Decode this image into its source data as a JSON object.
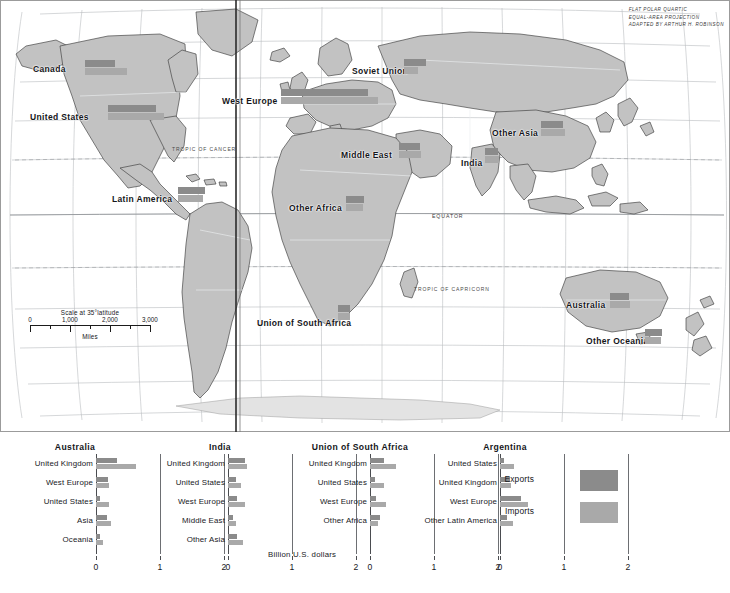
{
  "map": {
    "projection_note": "FLAT POLAR QUARTIC\nEQUAL-AREA PROJECTION\nADAPTED BY ARTHUR H. ROBINSON",
    "projection_line1": "FLAT POLAR QUARTIC",
    "projection_line2": "EQUAL-AREA PROJECTION",
    "projection_line3": "ADAPTED BY ARTHUR H. ROBINSON",
    "equator_label": "EQUATOR",
    "tropic_cancer_label": "TROPIC OF CANCER",
    "tropic_capricorn_label": "TROPIC OF CAPRICORN",
    "scale": {
      "caption": "Scale at 35°latitude",
      "unit": "Miles",
      "ticks": [
        "0",
        "1,000",
        "2,000",
        "3,000"
      ]
    },
    "regions": [
      {
        "label": "Canada",
        "label_x": 33,
        "label_y": 64,
        "sym_x": 85,
        "sym_y": 60,
        "exports": 30,
        "imports": 42
      },
      {
        "label": "United States",
        "label_x": 30,
        "label_y": 112,
        "sym_x": 108,
        "sym_y": 105,
        "exports": 48,
        "imports": 56
      },
      {
        "label": "Latin America",
        "label_x": 112,
        "label_y": 194,
        "sym_x": 178,
        "sym_y": 187,
        "exports": 27,
        "imports": 25
      },
      {
        "label": "West Europe",
        "label_x": 222,
        "label_y": 96,
        "sym_x": 281,
        "sym_y": 89,
        "exports": 87,
        "imports": 97
      },
      {
        "label": "Soviet Union",
        "label_x": 352,
        "label_y": 66,
        "sym_x": 404,
        "sym_y": 59,
        "exports": 22,
        "imports": 14
      },
      {
        "label": "Middle East",
        "label_x": 341,
        "label_y": 150,
        "sym_x": 399,
        "sym_y": 143,
        "exports": 21,
        "imports": 22
      },
      {
        "label": "Other Africa",
        "label_x": 289,
        "label_y": 203,
        "sym_x": 346,
        "sym_y": 196,
        "exports": 18,
        "imports": 17
      },
      {
        "label": "Other Asia",
        "label_x": 492,
        "label_y": 128,
        "sym_x": 541,
        "sym_y": 121,
        "exports": 22,
        "imports": 24
      },
      {
        "label": "India",
        "label_x": 461,
        "label_y": 158,
        "sym_x": 485,
        "sym_y": 148,
        "exports": 13,
        "imports": 14
      },
      {
        "label": "Australia",
        "label_x": 566,
        "label_y": 300,
        "sym_x": 610,
        "sym_y": 293,
        "exports": 19,
        "imports": 20
      },
      {
        "label": "Other Oceania",
        "label_x": 586,
        "label_y": 336,
        "sym_x": 645,
        "sym_y": 329,
        "exports": 17,
        "imports": 16
      },
      {
        "label": "Union of South Africa",
        "label_x": 257,
        "label_y": 318,
        "sym_x": 338,
        "sym_y": 305,
        "exports": 12,
        "imports": 12
      }
    ]
  },
  "legend": {
    "exports_label": "Exports",
    "imports_label": "Imports",
    "exports_color": "#8b8b8b",
    "imports_color": "#a9a9a9"
  },
  "charts": {
    "axis_caption": "Billion U.S. dollars",
    "axis_ticks": [
      "0",
      "1",
      "2"
    ]
  },
  "chart_data": [
    {
      "type": "bar",
      "title": "Australia",
      "xlabel": "Billion U.S. dollars",
      "ylabel": "",
      "xlim": [
        0,
        2
      ],
      "xticks": [
        0,
        1,
        2
      ],
      "grid": true,
      "legend_position": "right",
      "orientation": "horizontal",
      "categories": [
        "United Kingdom",
        "West Europe",
        "United States",
        "Asia",
        "Oceania"
      ],
      "series": [
        {
          "name": "Exports",
          "values": [
            0.33,
            0.18,
            0.06,
            0.17,
            0.07
          ]
        },
        {
          "name": "Imports",
          "values": [
            0.62,
            0.2,
            0.2,
            0.24,
            0.11
          ]
        }
      ]
    },
    {
      "type": "bar",
      "title": "India",
      "xlabel": "Billion U.S. dollars",
      "ylabel": "",
      "xlim": [
        0,
        2
      ],
      "xticks": [
        0,
        1,
        2
      ],
      "grid": true,
      "legend_position": "right",
      "orientation": "horizontal",
      "categories": [
        "United Kingdom",
        "United States",
        "West Europe",
        "Middle East",
        "Other Asia"
      ],
      "series": [
        {
          "name": "Exports",
          "values": [
            0.26,
            0.13,
            0.14,
            0.08,
            0.14
          ]
        },
        {
          "name": "Imports",
          "values": [
            0.3,
            0.21,
            0.27,
            0.13,
            0.24
          ]
        }
      ]
    },
    {
      "type": "bar",
      "title": "Union of South Africa",
      "xlabel": "Billion U.S. dollars",
      "ylabel": "",
      "xlim": [
        0,
        2
      ],
      "xticks": [
        0,
        1,
        2
      ],
      "grid": true,
      "legend_position": "right",
      "orientation": "horizontal",
      "categories": [
        "United Kingdom",
        "United States",
        "West Europe",
        "Other Africa"
      ],
      "series": [
        {
          "name": "Exports",
          "values": [
            0.22,
            0.08,
            0.1,
            0.16
          ]
        },
        {
          "name": "Imports",
          "values": [
            0.4,
            0.22,
            0.25,
            0.12
          ]
        }
      ]
    },
    {
      "type": "bar",
      "title": "Argentina",
      "xlabel": "Billion U.S. dollars",
      "ylabel": "",
      "xlim": [
        0,
        2
      ],
      "xticks": [
        0,
        1,
        2
      ],
      "grid": true,
      "legend_position": "right",
      "orientation": "horizontal",
      "categories": [
        "United States",
        "United Kingdom",
        "West Europe",
        "Other Latin America"
      ],
      "series": [
        {
          "name": "Exports",
          "values": [
            0.07,
            0.15,
            0.33,
            0.11
          ]
        },
        {
          "name": "Imports",
          "values": [
            0.22,
            0.17,
            0.44,
            0.2
          ]
        }
      ]
    }
  ]
}
